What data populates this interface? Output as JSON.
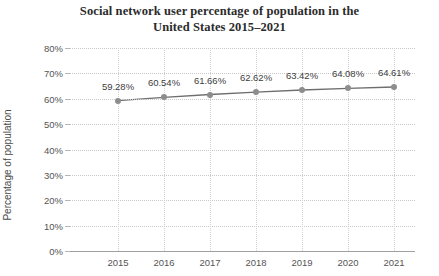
{
  "chart_data": {
    "type": "line",
    "title": "Social network user percentage of population in the United States 2015–2021",
    "title_lines": [
      "Social network user percentage of population in the",
      "United States 2015–2021"
    ],
    "xlabel": "",
    "ylabel": "Percentage of population",
    "categories": [
      "2015",
      "2016",
      "2017",
      "2018",
      "2019",
      "2020",
      "2021"
    ],
    "values": [
      59.28,
      60.54,
      61.66,
      62.62,
      63.42,
      64.08,
      64.61
    ],
    "point_labels": [
      "59.28%",
      "60.54%",
      "61.66%",
      "62.62%",
      "63.42%",
      "64.08%",
      "64.61%"
    ],
    "ylim": [
      0,
      80
    ],
    "yticks": [
      0,
      10,
      20,
      30,
      40,
      50,
      60,
      70,
      80
    ],
    "ytick_labels": [
      "0%",
      "10%",
      "20%",
      "30%",
      "40%",
      "50%",
      "60%",
      "70%",
      "80%"
    ],
    "grid": true,
    "grid_style": "dotted",
    "legend": "none",
    "series": [
      {
        "name": "Social network user percentage of population",
        "values": [
          59.28,
          60.54,
          61.66,
          62.62,
          63.42,
          64.08,
          64.61
        ]
      }
    ],
    "colors": {
      "line": "#6e6e6e",
      "marker": "#8d8d8d",
      "grid": "#c9c9c9",
      "axis": "#a0a0a0",
      "title_text": "#2b2b2b",
      "tick_text": "#555555",
      "label_text": "#3d3d3d",
      "background": "#ffffff"
    }
  }
}
